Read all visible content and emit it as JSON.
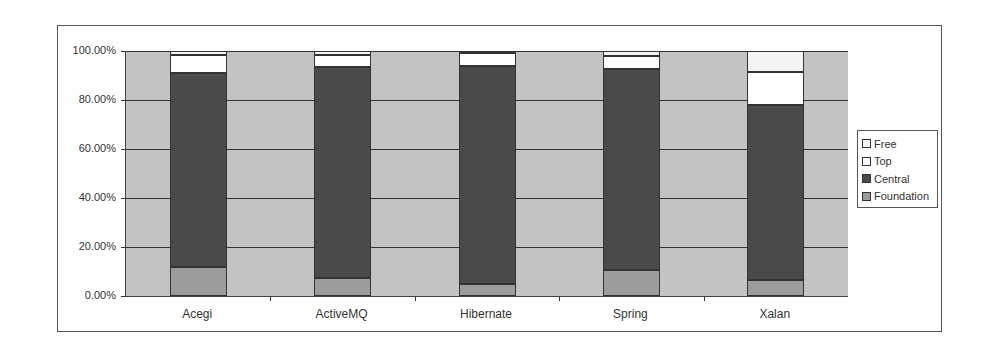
{
  "chart_data": {
    "type": "bar",
    "stacked": "percent",
    "title": "",
    "xlabel": "",
    "ylabel": "",
    "ylim": [
      0,
      100
    ],
    "y_ticks": [
      "0.00%",
      "20.00%",
      "40.00%",
      "60.00%",
      "80.00%",
      "100.00%"
    ],
    "grid": true,
    "legend_position": "right",
    "categories": [
      "Acegi",
      "ActiveMQ",
      "Hibernate",
      "Spring",
      "Xalan"
    ],
    "series": [
      {
        "name": "Foundation",
        "color": "#9c9c9c",
        "values": [
          12.0,
          7.5,
          5.0,
          10.5,
          6.5
        ]
      },
      {
        "name": "Central",
        "color": "#4a4a4a",
        "values": [
          79.0,
          86.0,
          89.0,
          82.0,
          71.5
        ]
      },
      {
        "name": "Top",
        "color": "#ffffff",
        "values": [
          7.5,
          5.0,
          5.0,
          5.5,
          13.5
        ]
      },
      {
        "name": "Free",
        "color": "#f4f4f4",
        "values": [
          1.5,
          1.5,
          1.0,
          2.0,
          8.5
        ]
      }
    ]
  },
  "legend": {
    "items": [
      {
        "label": "Free",
        "color": "#f4f4f4"
      },
      {
        "label": "Top",
        "color": "#ffffff"
      },
      {
        "label": "Central",
        "color": "#4a4a4a"
      },
      {
        "label": "Foundation",
        "color": "#9c9c9c"
      }
    ]
  }
}
